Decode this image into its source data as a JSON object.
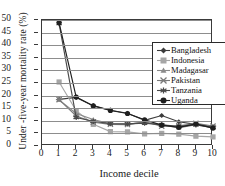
{
  "chart_data": {
    "type": "line",
    "title": "",
    "xlabel": "Income decile",
    "ylabel": "Under -five-year mortality rate (%)",
    "x": [
      1,
      2,
      3,
      4,
      5,
      6,
      7,
      8,
      9,
      10
    ],
    "xlim": [
      0,
      10
    ],
    "ylim": [
      0,
      50
    ],
    "xticks": [
      "0",
      "1",
      "2",
      "3",
      "4",
      "5",
      "6",
      "7",
      "8",
      "9",
      "10"
    ],
    "yticks": [
      "0",
      "5",
      "10",
      "15",
      "20",
      "25",
      "30",
      "35",
      "40",
      "45",
      "50"
    ],
    "grid": "horizontal",
    "legend_position": "top-right-inside",
    "series": [
      {
        "name": "Bangladesh",
        "marker": "diamond",
        "color": "#3c3c3c",
        "values": [
          18.5,
          19.3,
          16.0,
          14.2,
          13.0,
          10.2,
          12.1,
          9.6,
          8.6,
          7.6
        ]
      },
      {
        "name": "Indonesia",
        "marker": "square",
        "color": "#a6a6a6",
        "values": [
          25.4,
          14.0,
          8.6,
          5.7,
          5.6,
          4.8,
          5.0,
          4.7,
          3.9,
          3.6
        ]
      },
      {
        "name": "Madagasar",
        "marker": "triangle",
        "color": "#8a8a8a",
        "values": [
          18.3,
          12.9,
          10.5,
          8.8,
          8.7,
          9.4,
          8.5,
          7.2,
          8.5,
          7.2
        ]
      },
      {
        "name": "Pakistan",
        "marker": "x-star",
        "color": "#7a7a7a",
        "values": [
          18.4,
          11.9,
          9.4,
          8.6,
          8.5,
          9.6,
          7.9,
          8.0,
          9.0,
          7.9
        ]
      },
      {
        "name": "Tanzania",
        "marker": "asterisk",
        "color": "#4a4a4a",
        "values": [
          48.6,
          11.3,
          9.8,
          8.9,
          8.8,
          9.1,
          8.4,
          7.8,
          8.4,
          7.4
        ]
      },
      {
        "name": "Uganda",
        "marker": "circle",
        "color": "#1f1f1f",
        "values": [
          48.9,
          19.4,
          15.9,
          14.1,
          12.9,
          10.4,
          8.3,
          7.4,
          8.8,
          7.1
        ]
      }
    ]
  }
}
